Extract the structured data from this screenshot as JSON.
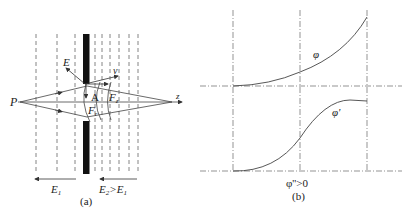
{
  "panel_a": {
    "caption": "(a)",
    "labels": {
      "source": "P",
      "axis": "z",
      "field": "E",
      "velocity": "v",
      "point": "A",
      "force_z": "F",
      "force_z_sub": "z",
      "force_r": "F",
      "force_r_sub": "r",
      "left_field": "E",
      "left_field_sub": "1",
      "right_field": "E",
      "right_field_sub": "2",
      "right_field_cmp": ">E",
      "right_field_cmp_sub": "1"
    },
    "colors": {
      "line": "#444444",
      "electrode": "#111111"
    }
  },
  "panel_b": {
    "caption": "(b)",
    "curve_top_label": "φ",
    "curve_bottom_label": "φ'",
    "condition": "φ''>0",
    "colors": {
      "line": "#444444",
      "grid": "#666666"
    }
  }
}
